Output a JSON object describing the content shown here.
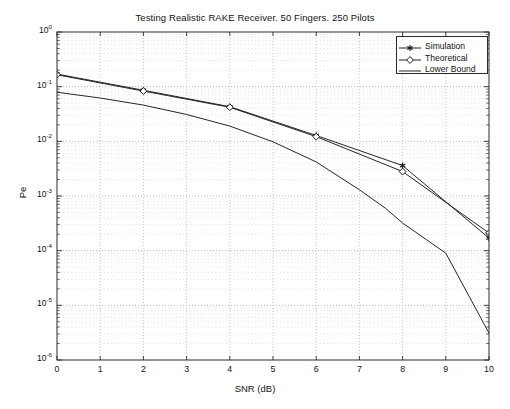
{
  "chart_data": {
    "type": "line",
    "title": "Testing Realistic RAKE Receiver. 50 Fingers. 250 Pilots",
    "xlabel": "SNR (dB)",
    "ylabel": "Pe",
    "xlim": [
      0,
      10
    ],
    "ylim": [
      1e-06,
      1
    ],
    "yscale": "log",
    "xscale": "linear",
    "grid": true,
    "grid_style": "dotted-minor-log",
    "legend_position": "upper-right",
    "xticks": [
      "0",
      "1",
      "2",
      "3",
      "4",
      "5",
      "6",
      "7",
      "8",
      "9",
      "10"
    ],
    "yticks": [
      {
        "label": "10",
        "exp": "0",
        "value": 1
      },
      {
        "label": "10",
        "exp": "-1",
        "value": 0.1
      },
      {
        "label": "10",
        "exp": "-2",
        "value": 0.01
      },
      {
        "label": "10",
        "exp": "-3",
        "value": 0.001
      },
      {
        "label": "10",
        "exp": "-4",
        "value": 0.0001
      },
      {
        "label": "10",
        "exp": "-5",
        "value": 1e-05
      },
      {
        "label": "10",
        "exp": "-6",
        "value": 1e-06
      }
    ],
    "series": [
      {
        "name": "Simulation",
        "marker": "star",
        "color": "#1a1a1a",
        "x": [
          0,
          2,
          4,
          6,
          8,
          10
        ],
        "values": [
          0.17,
          0.086,
          0.043,
          0.0128,
          0.0036,
          0.00017
        ]
      },
      {
        "name": "Theoretical",
        "marker": "diamond",
        "color": "#1a1a1a",
        "x": [
          0,
          2,
          4,
          6,
          8,
          10
        ],
        "values": [
          0.165,
          0.083,
          0.042,
          0.0122,
          0.0028,
          0.00021
        ]
      },
      {
        "name": "Lower Bound",
        "marker": "none",
        "color": "#1a1a1a",
        "x": [
          0,
          1,
          2,
          3,
          4,
          5,
          6,
          7,
          7.6,
          8,
          9,
          10
        ],
        "values": [
          0.079,
          0.062,
          0.046,
          0.031,
          0.019,
          0.0098,
          0.0042,
          0.0013,
          0.0006,
          0.00032,
          9e-05,
          3.1e-06
        ]
      }
    ]
  },
  "legend": {
    "entries": [
      {
        "label": "Simulation",
        "marker": "star"
      },
      {
        "label": "Theoretical",
        "marker": "diamond"
      },
      {
        "label": "Lower Bound",
        "marker": "none"
      }
    ]
  }
}
